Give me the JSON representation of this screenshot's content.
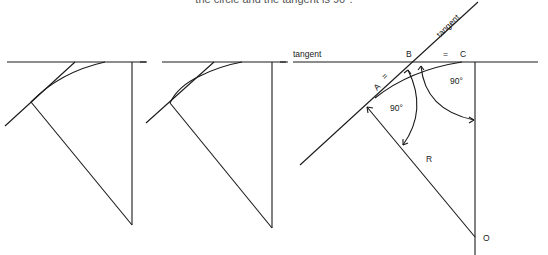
{
  "caption": "the circle and the tangent is 90°.",
  "figures": [
    {
      "id": "fig1",
      "description": "tangent line crossing arc, radius and vertical to center"
    },
    {
      "id": "fig2",
      "description": "tangent line crossing arc at two points, radius and vertical to center"
    },
    {
      "id": "fig3",
      "labels": {
        "tangent_horizontal": "tangent",
        "tangent_slanted": "tangent",
        "point_a": "A",
        "point_b": "B",
        "point_c": "C",
        "point_o": "O",
        "radius": "R",
        "equal_ab": "=",
        "equal_bc": "=",
        "angle_left": "90°",
        "angle_right": "90°"
      }
    }
  ]
}
